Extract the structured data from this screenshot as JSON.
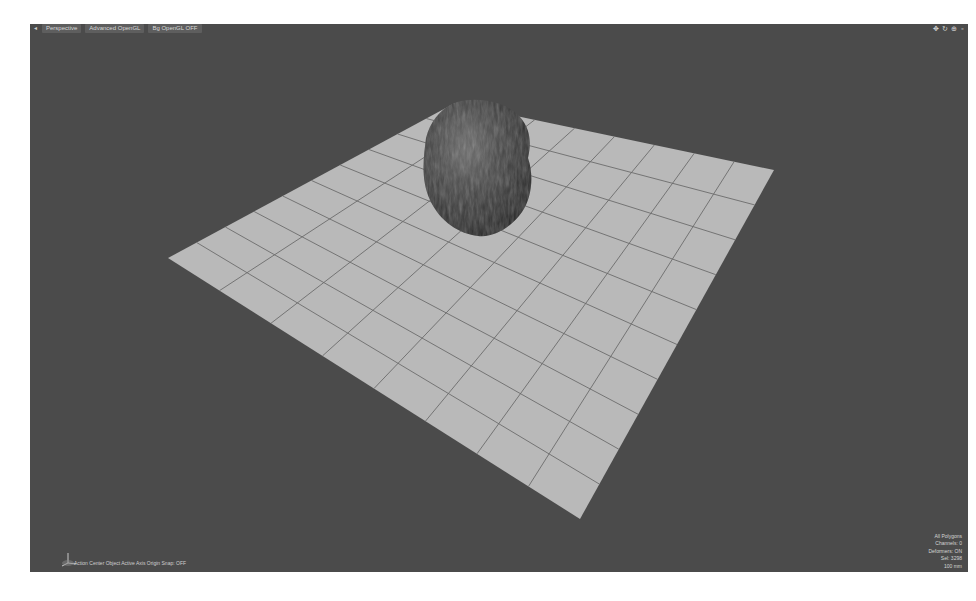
{
  "viewport": {
    "menu_icon": "viewport-menu-arrow",
    "view_type": "Perspective",
    "render_mode": "Advanced OpenGL",
    "vbo_toggle": "Bg OpenGL OFF",
    "tools": [
      "move-view-icon",
      "rotate-view-icon",
      "zoom-view-icon",
      "maximize-icon"
    ],
    "tool_glyphs": [
      "✥",
      "↻",
      "⊕",
      "▫"
    ]
  },
  "status_bar": {
    "text": "Action Center Object   Active Axis Origin   Snap: OFF"
  },
  "info_panel": {
    "lines": [
      "All Polygons",
      "Channels: 0",
      "Deformers: ON",
      "Sel: 3298",
      "100 mm"
    ]
  },
  "scene": {
    "background_color": "#4b4b4b",
    "ground_plane": {
      "color": "#b9b9b9",
      "grid_color": "#6c6c6c",
      "corners": {
        "left": [
          168,
          258
        ],
        "top": [
          455,
          103
        ],
        "right": [
          774,
          170
        ],
        "bottom": [
          580,
          519
        ]
      },
      "divisions_a": 8,
      "divisions_b": 10
    },
    "object": "rock",
    "object_color": "#3a3a3a"
  }
}
